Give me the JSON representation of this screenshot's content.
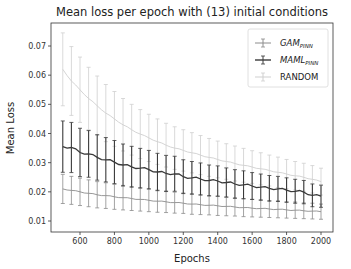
{
  "chart_data": {
    "type": "line",
    "title": "Mean loss per epoch with (13) initial conditions",
    "xlabel": "Epochs",
    "ylabel": "Mean Loss",
    "xlim": [
      450,
      2080
    ],
    "ylim": [
      0.0055,
      0.078
    ],
    "xticks": [
      600,
      800,
      1000,
      1200,
      1400,
      1600,
      1800,
      2000
    ],
    "yticks": [
      0.01,
      0.02,
      0.03,
      0.04,
      0.05,
      0.06,
      0.07
    ],
    "ytick_labels": [
      "0.01",
      "0.02",
      "0.03",
      "0.04",
      "0.05",
      "0.06",
      "0.07"
    ],
    "grid": false,
    "legend_position": "upper right",
    "error_bars": true,
    "x": [
      500,
      550,
      600,
      650,
      700,
      750,
      800,
      850,
      900,
      950,
      1000,
      1050,
      1100,
      1150,
      1200,
      1250,
      1300,
      1350,
      1400,
      1450,
      1500,
      1550,
      1600,
      1650,
      1700,
      1750,
      1800,
      1850,
      1900,
      1950,
      2000
    ],
    "series": [
      {
        "name": "GAM_PINN",
        "label_main": "GAM",
        "label_sub": "PINN",
        "color": "#8c8c8c",
        "values": [
          0.021,
          0.0205,
          0.02,
          0.0195,
          0.019,
          0.0187,
          0.0183,
          0.018,
          0.0177,
          0.0174,
          0.0171,
          0.0168,
          0.0166,
          0.0163,
          0.0161,
          0.0158,
          0.0156,
          0.0154,
          0.0152,
          0.015,
          0.0148,
          0.0146,
          0.0144,
          0.0143,
          0.0141,
          0.014,
          0.0138,
          0.0137,
          0.0135,
          0.0134,
          0.0132
        ],
        "err": [
          0.005,
          0.0048,
          0.0047,
          0.0046,
          0.0045,
          0.0044,
          0.0043,
          0.0042,
          0.0041,
          0.004,
          0.0039,
          0.0038,
          0.0037,
          0.0036,
          0.0035,
          0.0035,
          0.0034,
          0.0033,
          0.0033,
          0.0032,
          0.0031,
          0.0031,
          0.003,
          0.003,
          0.0029,
          0.0029,
          0.0028,
          0.0028,
          0.0027,
          0.0027,
          0.0026
        ]
      },
      {
        "name": "MAML_PINN",
        "label_main": "MAML",
        "label_sub": "PINN",
        "color": "#3a3a3a",
        "values": [
          0.0355,
          0.0352,
          0.0335,
          0.033,
          0.0318,
          0.031,
          0.0302,
          0.0292,
          0.0286,
          0.0281,
          0.0276,
          0.0268,
          0.0263,
          0.0262,
          0.0252,
          0.0248,
          0.0244,
          0.0239,
          0.0237,
          0.0232,
          0.0227,
          0.0224,
          0.022,
          0.0216,
          0.0212,
          0.021,
          0.0206,
          0.0202,
          0.0199,
          0.0188,
          0.0185
        ],
        "err": [
          0.0088,
          0.0086,
          0.0083,
          0.008,
          0.0078,
          0.0076,
          0.0074,
          0.0072,
          0.007,
          0.0068,
          0.0066,
          0.0064,
          0.0062,
          0.006,
          0.0058,
          0.0056,
          0.0055,
          0.0053,
          0.0052,
          0.005,
          0.0049,
          0.0048,
          0.0046,
          0.0045,
          0.0044,
          0.0043,
          0.0042,
          0.0041,
          0.004,
          0.0039,
          0.0038
        ]
      },
      {
        "name": "RANDOM",
        "label_main": "RANDOM",
        "label_sub": "",
        "color": "#cfcfcf",
        "values": [
          0.062,
          0.058,
          0.055,
          0.052,
          0.0495,
          0.047,
          0.045,
          0.043,
          0.0413,
          0.0398,
          0.0385,
          0.0372,
          0.036,
          0.035,
          0.0342,
          0.0334,
          0.0326,
          0.0318,
          0.0311,
          0.0304,
          0.0297,
          0.0291,
          0.0285,
          0.0279,
          0.0273,
          0.0267,
          0.0261,
          0.0255,
          0.025,
          0.0243,
          0.0235
        ],
        "err": [
          0.0125,
          0.0118,
          0.0112,
          0.0107,
          0.0102,
          0.0098,
          0.0094,
          0.009,
          0.0087,
          0.0084,
          0.0081,
          0.0078,
          0.0075,
          0.0073,
          0.0071,
          0.0069,
          0.0067,
          0.0065,
          0.0063,
          0.0061,
          0.006,
          0.0058,
          0.0056,
          0.0055,
          0.0053,
          0.0052,
          0.005,
          0.0049,
          0.0048,
          0.0047,
          0.0046
        ]
      }
    ]
  }
}
